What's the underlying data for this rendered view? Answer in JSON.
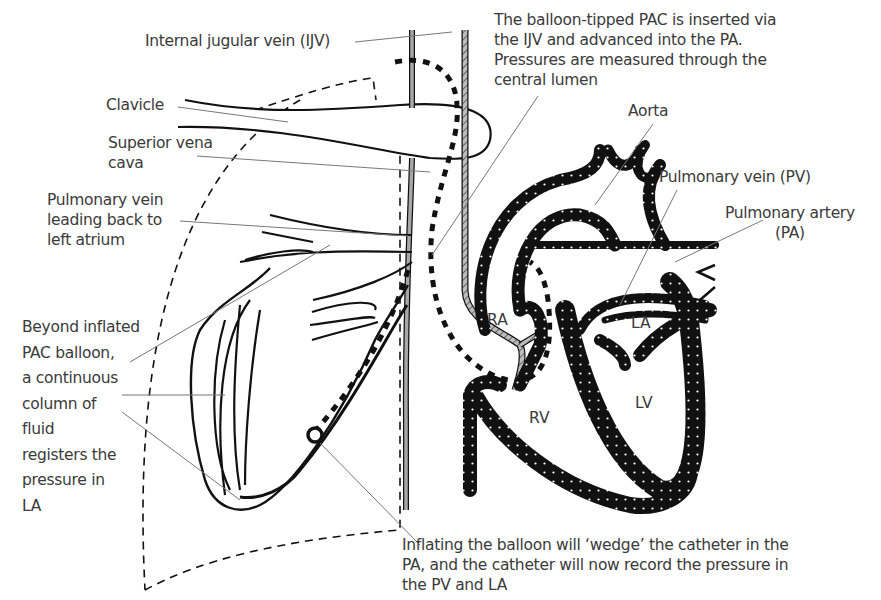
{
  "labels": {
    "ijv": "Internal jugular vein (IJV)",
    "clavicle": "Clavicle",
    "svc": "Superior vena\ncava",
    "pv_left": "Pulmonary vein\nleading back to\nleft atrium",
    "beyond": "Beyond inflated\nPAC balloon,\na continuous\ncolumn of\nfluid\nregisters the\npressure in\nLA",
    "pac_insert": "The balloon-tipped PAC is inserted via\nthe IJV and advanced into the PA.\nPressures are measured through the\ncentral lumen",
    "aorta": "Aorta",
    "pv": "Pulmonary vein (PV)",
    "pa": "Pulmonary artery\n(PA)",
    "inflating": "Inflating the balloon will ‘wedge’ the catheter in the\nPA, and the catheter will now record the pressure in\nthe PV and LA"
  },
  "chambers": {
    "ra": "RA",
    "la": "LA",
    "rv": "RV",
    "lv": "LV"
  },
  "colors": {
    "ink": "#111111",
    "label_text": "#3a3a3a",
    "leader": "#777777",
    "vessel_grey": "#a8a8a8",
    "background": "#ffffff"
  }
}
